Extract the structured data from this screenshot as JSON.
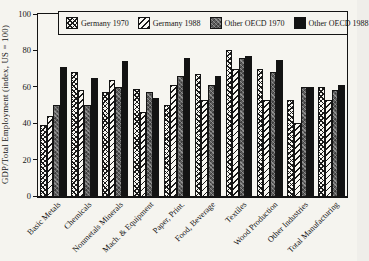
{
  "chart_data": {
    "type": "bar",
    "title": "",
    "ylabel": "GDP/Total Employment (index, US = 100)",
    "xlabel": "",
    "ylim": [
      0,
      100
    ],
    "yticks": [
      0,
      20,
      40,
      60,
      80,
      100
    ],
    "grid": false,
    "legend_position": "top-inside",
    "categories": [
      "Basic Metals",
      "Chemicals",
      "Nonmetals Minerals",
      "Mach. & Equipment",
      "Paper, Print.",
      "Food, Beverage",
      "Textiles",
      "Wood Production",
      "Other Industries",
      "Total Manufacturing"
    ],
    "series": [
      {
        "name": "Germany 1970",
        "pattern": "crosshatch",
        "values": [
          39,
          68,
          57,
          59,
          50,
          67,
          80,
          70,
          53,
          60
        ]
      },
      {
        "name": "Germany 1988",
        "pattern": "diagonal",
        "values": [
          44,
          58,
          64,
          46,
          61,
          53,
          70,
          53,
          40,
          53
        ]
      },
      {
        "name": "Other OECD 1970",
        "pattern": "stipple-gray",
        "values": [
          50,
          50,
          60,
          57,
          66,
          61,
          76,
          68,
          60,
          58
        ]
      },
      {
        "name": "Other OECD 1988",
        "pattern": "solid-black",
        "values": [
          71,
          65,
          74,
          54,
          76,
          66,
          77,
          75,
          60,
          61
        ]
      }
    ]
  },
  "colors": {
    "background": "#f5f4ef",
    "axis": "#141414",
    "bar_black": "#131313",
    "bar_gray": "#5e5e5e"
  }
}
